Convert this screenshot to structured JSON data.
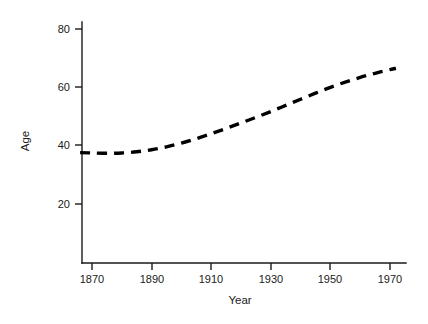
{
  "chart_data": {
    "type": "line",
    "title": "",
    "subtitle": "",
    "xlabel": "Year",
    "ylabel": "Age",
    "xlim": [
      1866,
      1974
    ],
    "ylim": [
      0,
      84
    ],
    "grid": false,
    "legend": null,
    "line_style": "dashed",
    "line_color": "#000000",
    "x_ticks": [
      1870,
      1890,
      1910,
      1930,
      1950,
      1970
    ],
    "x_tick_labels": [
      "1870",
      "1890",
      "1910",
      "1930",
      "1950",
      "1970"
    ],
    "y_ticks": [
      20,
      40,
      60,
      80
    ],
    "y_tick_labels": [
      "20",
      "40",
      "60",
      "80"
    ],
    "series": [
      {
        "name": "Life expectancy",
        "x": [
          1866,
          1870,
          1875,
          1880,
          1885,
          1890,
          1895,
          1900,
          1905,
          1910,
          1915,
          1920,
          1925,
          1930,
          1935,
          1940,
          1945,
          1950,
          1955,
          1960,
          1965,
          1970,
          1972
        ],
        "values": [
          37.6,
          37.5,
          37.4,
          37.5,
          37.9,
          38.6,
          39.6,
          40.9,
          42.4,
          44.1,
          45.9,
          47.8,
          49.7,
          51.7,
          53.8,
          55.9,
          58.0,
          60.0,
          61.8,
          63.4,
          64.8,
          66.1,
          66.5
        ]
      }
    ]
  },
  "axis": {
    "y_title": "Age",
    "x_title": "Year"
  },
  "geometry": {
    "x_pixel_at_1870": 92,
    "x_pixel_at_1970": 390,
    "y_pixel_at_20": 204,
    "y_pixel_at_80": 29,
    "axis_origin_x": 82,
    "axis_origin_y": 263,
    "axis_top_y": 22,
    "axis_right_x": 406
  }
}
